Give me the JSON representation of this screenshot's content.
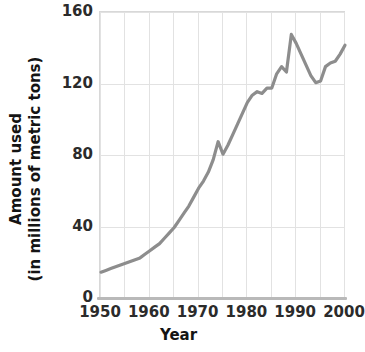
{
  "chart_data": {
    "type": "line",
    "title": "",
    "xlabel": "Year",
    "ylabel_line1": "Amount used",
    "ylabel_line2": "(in millions of metric tons)",
    "xlim": [
      1950,
      2000
    ],
    "ylim": [
      0,
      160
    ],
    "x_ticks": [
      "1950",
      "1960",
      "1970",
      "1980",
      "1990",
      "2000"
    ],
    "x_tick_values": [
      1950,
      1960,
      1970,
      1980,
      1990,
      2000
    ],
    "y_ticks": [
      "0",
      "40",
      "80",
      "120",
      "160"
    ],
    "y_tick_values": [
      0,
      40,
      80,
      120,
      160
    ],
    "x_gridlines": [
      1950,
      1955,
      1960,
      1965,
      1970,
      1975,
      1980,
      1985,
      1990,
      1995,
      2000
    ],
    "y_gridlines": [
      0,
      40,
      80,
      120,
      160
    ],
    "grid": true,
    "legend": "none",
    "line_color": "#8d8d8d",
    "grid_color": "#e2e2e2",
    "axis_color": "#b9b9b9",
    "text_color": "#141414",
    "series": [
      {
        "name": "Amount used",
        "x": [
          1950,
          1951,
          1952,
          1953,
          1954,
          1955,
          1956,
          1957,
          1958,
          1959,
          1960,
          1961,
          1962,
          1963,
          1964,
          1965,
          1966,
          1967,
          1968,
          1969,
          1970,
          1971,
          1972,
          1973,
          1974,
          1975,
          1976,
          1977,
          1978,
          1979,
          1980,
          1981,
          1982,
          1983,
          1984,
          1985,
          1986,
          1987,
          1988,
          1989,
          1990,
          1991,
          1992,
          1993,
          1994,
          1995,
          1996,
          1997,
          1998,
          1999,
          2000
        ],
        "values": [
          15,
          16,
          17,
          18,
          19,
          20,
          21,
          22,
          23,
          25,
          27,
          29,
          31,
          34,
          37,
          40,
          44,
          48,
          52,
          57,
          62,
          66,
          71,
          78,
          88,
          81,
          86,
          92,
          98,
          104,
          110,
          114,
          116,
          115,
          118,
          118,
          126,
          130,
          127,
          148,
          143,
          137,
          131,
          125,
          121,
          122,
          130,
          132,
          133,
          137,
          142
        ]
      }
    ]
  }
}
